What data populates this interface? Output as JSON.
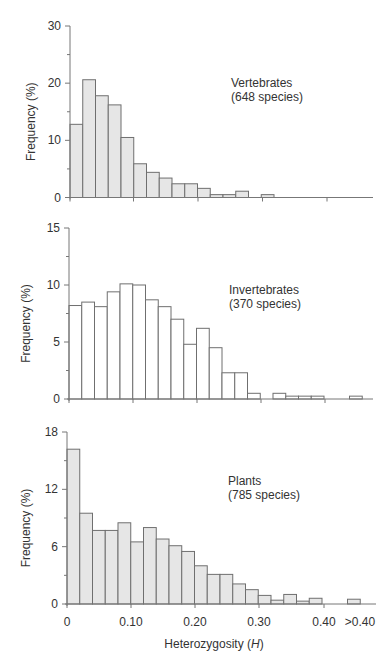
{
  "figure": {
    "xlabel": "Heterozygosity (",
    "xlabel_italic": "H",
    "xlabel_close": ")",
    "x_tick_labels": [
      "0",
      "0.10",
      "0.20",
      "0.30",
      "0.40",
      ">0.40"
    ]
  },
  "colors": {
    "fill_shaded": "#e6e6e6",
    "fill_open": "#ffffff",
    "edge": "#6f6f6f",
    "axis": "#777777"
  },
  "chart_data": [
    {
      "type": "bar",
      "title": "Vertebrates",
      "subtitle": "(648 species)",
      "xlabel": "Heterozygosity (H)",
      "ylabel": "Frequency (%)",
      "ylim": [
        0,
        30
      ],
      "y_ticks": [
        0,
        10,
        20,
        30
      ],
      "y_minor_ticks": [
        5,
        15,
        25
      ],
      "bin_width": 0.02,
      "fill": "shaded",
      "categories": [
        "0.00-0.02",
        "0.02-0.04",
        "0.04-0.06",
        "0.06-0.08",
        "0.08-0.10",
        "0.10-0.12",
        "0.12-0.14",
        "0.14-0.16",
        "0.16-0.18",
        "0.18-0.20",
        "0.20-0.22",
        "0.22-0.24",
        "0.24-0.26",
        "0.26-0.28",
        "0.28-0.30",
        "0.30-0.32",
        "0.32-0.34",
        "0.34-0.36",
        "0.36-0.38",
        "0.38-0.40",
        "0.40-0.42",
        "0.42-0.44",
        "0.44-0.46"
      ],
      "values": [
        12.8,
        20.6,
        17.8,
        16.2,
        10.5,
        5.9,
        4.4,
        3.4,
        2.4,
        2.4,
        1.6,
        0.5,
        0.5,
        1.1,
        0,
        0.5,
        0,
        0,
        0,
        0,
        0,
        0,
        0
      ],
      "grid": false
    },
    {
      "type": "bar",
      "title": "Invertebrates",
      "subtitle": "(370 species)",
      "xlabel": "Heterozygosity (H)",
      "ylabel": "Frequency (%)",
      "ylim": [
        0,
        15
      ],
      "y_ticks": [
        0,
        5,
        10,
        15
      ],
      "y_minor_ticks": [
        2.5,
        7.5,
        12.5
      ],
      "bin_width": 0.02,
      "fill": "open",
      "categories": [
        "0.00-0.02",
        "0.02-0.04",
        "0.04-0.06",
        "0.06-0.08",
        "0.08-0.10",
        "0.10-0.12",
        "0.12-0.14",
        "0.14-0.16",
        "0.16-0.18",
        "0.18-0.20",
        "0.20-0.22",
        "0.22-0.24",
        "0.24-0.26",
        "0.26-0.28",
        "0.28-0.30",
        "0.30-0.32",
        "0.32-0.34",
        "0.34-0.36",
        "0.36-0.38",
        "0.38-0.40",
        "0.40-0.42",
        "0.42-0.44",
        "0.44-0.46"
      ],
      "values": [
        8.2,
        8.5,
        8.1,
        9.4,
        10.1,
        10.0,
        8.7,
        8.1,
        7.0,
        4.8,
        6.2,
        4.5,
        2.3,
        2.3,
        0.5,
        0,
        0.5,
        0.25,
        0.25,
        0.25,
        0,
        0,
        0.25
      ],
      "grid": false
    },
    {
      "type": "bar",
      "title": "Plants",
      "subtitle": "(785 species)",
      "xlabel": "Heterozygosity (H)",
      "ylabel": "Frequency (%)",
      "ylim": [
        0,
        18
      ],
      "y_ticks": [
        0,
        6,
        12,
        18
      ],
      "y_minor_ticks": [
        3,
        9,
        15
      ],
      "bin_width": 0.02,
      "fill": "shaded",
      "x_tick_labels": [
        "0",
        "0.10",
        "0.20",
        "0.30",
        "0.40",
        ">0.40"
      ],
      "categories": [
        "0.00-0.02",
        "0.02-0.04",
        "0.04-0.06",
        "0.06-0.08",
        "0.08-0.10",
        "0.10-0.12",
        "0.12-0.14",
        "0.14-0.16",
        "0.16-0.18",
        "0.18-0.20",
        "0.20-0.22",
        "0.22-0.24",
        "0.24-0.26",
        "0.26-0.28",
        "0.28-0.30",
        "0.30-0.32",
        "0.32-0.34",
        "0.34-0.36",
        "0.36-0.38",
        "0.38-0.40",
        "0.40-0.42",
        "0.42-0.44",
        ">0.40"
      ],
      "values": [
        16.2,
        9.5,
        7.7,
        7.7,
        8.5,
        6.5,
        8.0,
        6.8,
        6.1,
        5.5,
        4.0,
        3.1,
        3.1,
        2.1,
        1.5,
        0.9,
        0.4,
        1.0,
        0.3,
        0.6,
        0,
        0,
        0.5
      ],
      "grid": false
    }
  ]
}
